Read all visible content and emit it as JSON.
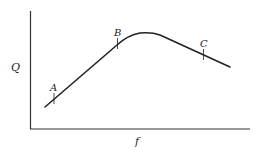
{
  "diagram": {
    "y_axis_label": "Q",
    "x_axis_label": "f",
    "points": [
      {
        "label": "A",
        "x": 54,
        "y": 98
      },
      {
        "label": "B",
        "x": 117,
        "y": 43
      },
      {
        "label": "C",
        "x": 204,
        "y": 54
      }
    ],
    "colors": {
      "line": "#222222",
      "axis": "#333333",
      "background": "#ffffff"
    }
  }
}
